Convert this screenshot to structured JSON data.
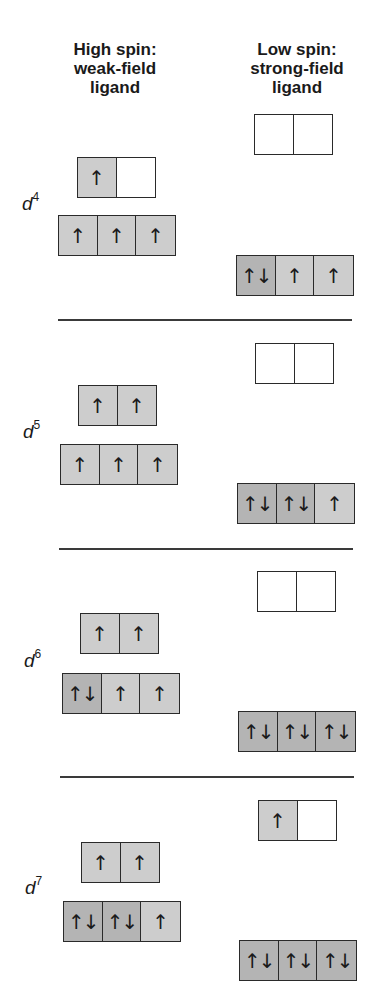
{
  "headers": {
    "high_spin": [
      "High spin:",
      "weak-field",
      "ligand"
    ],
    "low_spin": [
      "Low spin:",
      "strong-field",
      "ligand"
    ]
  },
  "colors": {
    "empty": "#ffffff",
    "single": "#cdcdcd",
    "paired": "#b4b4b4",
    "line": "#2a2a2a"
  },
  "symbols": {
    "single": "↑",
    "paired": "↑↓",
    "empty": ""
  },
  "sections": [
    {
      "label": "d",
      "exponent": "4",
      "high_spin": {
        "eg": [
          "single",
          "empty"
        ],
        "t2g": [
          "single",
          "single",
          "single"
        ]
      },
      "low_spin": {
        "eg": [
          "empty",
          "empty"
        ],
        "t2g": [
          "paired",
          "single",
          "single"
        ]
      }
    },
    {
      "label": "d",
      "exponent": "5",
      "high_spin": {
        "eg": [
          "single",
          "single"
        ],
        "t2g": [
          "single",
          "single",
          "single"
        ]
      },
      "low_spin": {
        "eg": [
          "empty",
          "empty"
        ],
        "t2g": [
          "paired",
          "paired",
          "single"
        ]
      }
    },
    {
      "label": "d",
      "exponent": "6",
      "high_spin": {
        "eg": [
          "single",
          "single"
        ],
        "t2g": [
          "paired",
          "single",
          "single"
        ]
      },
      "low_spin": {
        "eg": [
          "empty",
          "empty"
        ],
        "t2g": [
          "paired",
          "paired",
          "paired"
        ]
      }
    },
    {
      "label": "d",
      "exponent": "7",
      "high_spin": {
        "eg": [
          "single",
          "single"
        ],
        "t2g": [
          "paired",
          "paired",
          "single"
        ]
      },
      "low_spin": {
        "eg": [
          "single",
          "empty"
        ],
        "t2g": [
          "paired",
          "paired",
          "paired"
        ]
      }
    }
  ]
}
